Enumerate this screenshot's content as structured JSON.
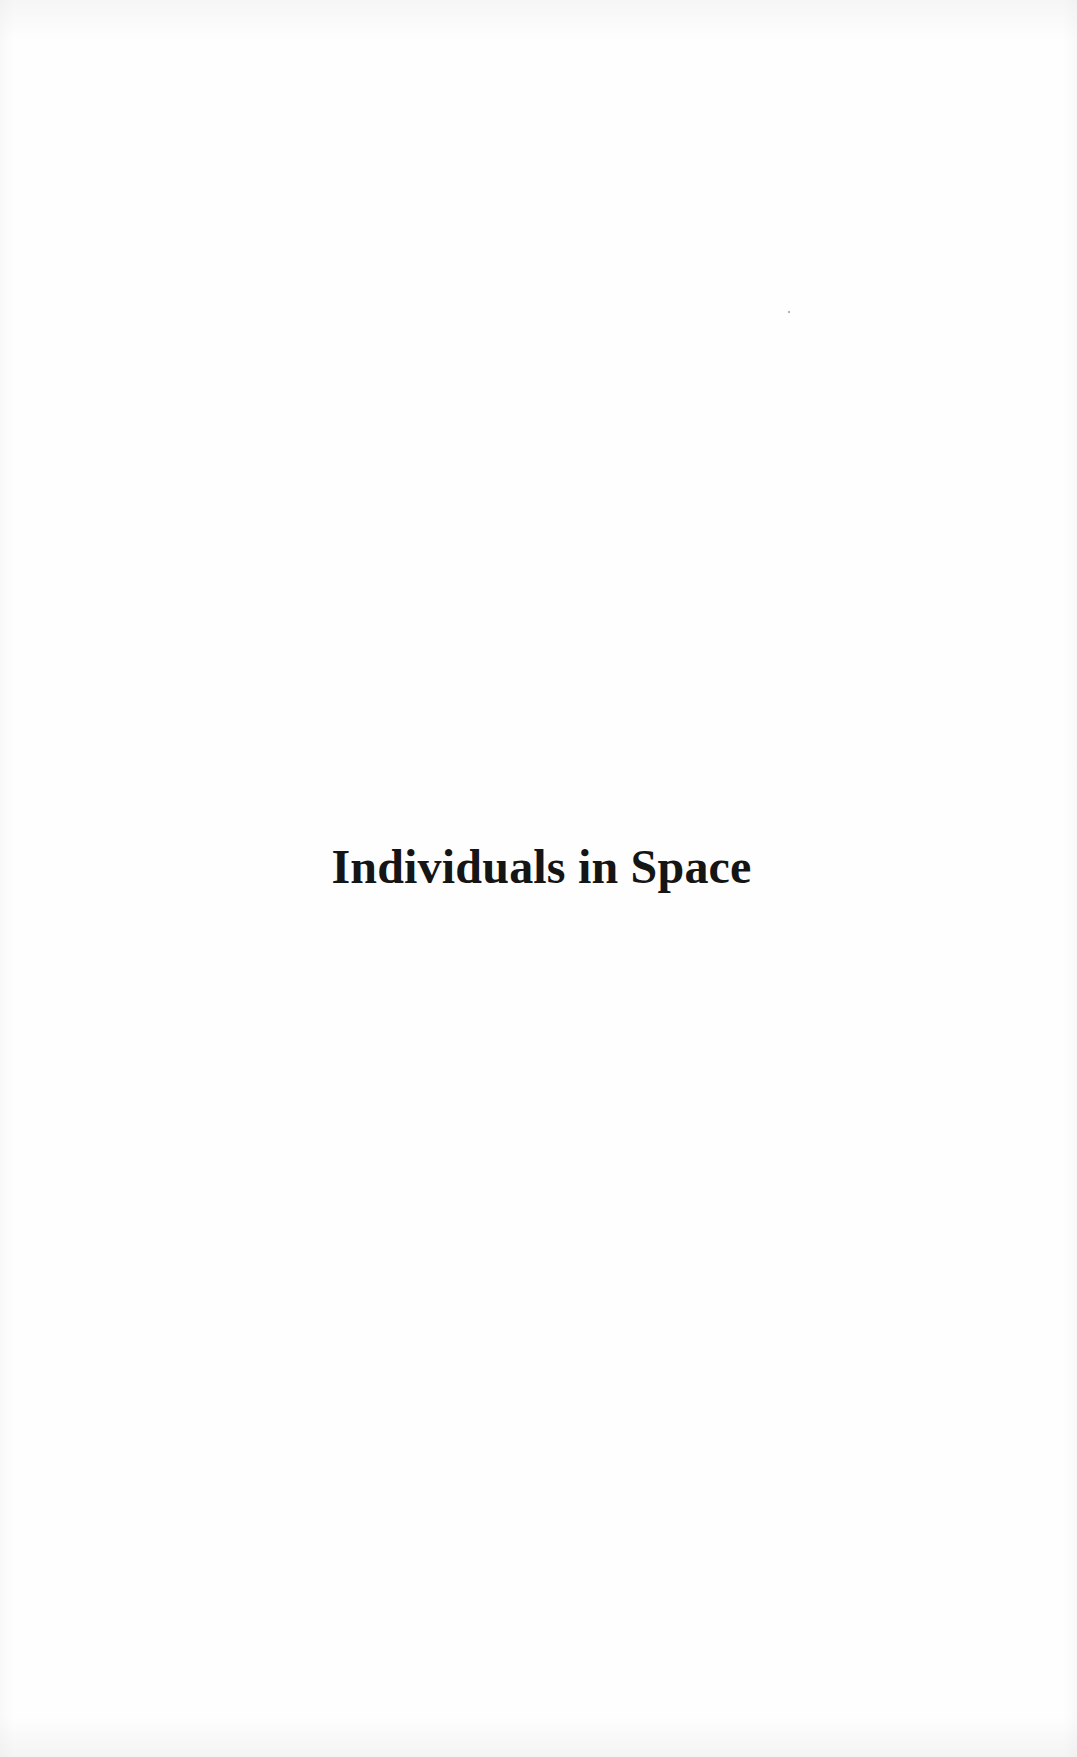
{
  "page": {
    "type": "half-title",
    "title": "Individuals in Space"
  }
}
